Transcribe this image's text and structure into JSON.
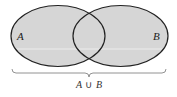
{
  "diagram": {
    "type": "venn",
    "sets": [
      {
        "label": "A",
        "shaded": true
      },
      {
        "label": "B",
        "shaded": true
      }
    ],
    "union_label_left": "A",
    "union_symbol": "∪",
    "union_label_right": "B",
    "colors": {
      "fill": "#d6d6d6",
      "stroke": "#222222",
      "brace": "#777777"
    }
  }
}
